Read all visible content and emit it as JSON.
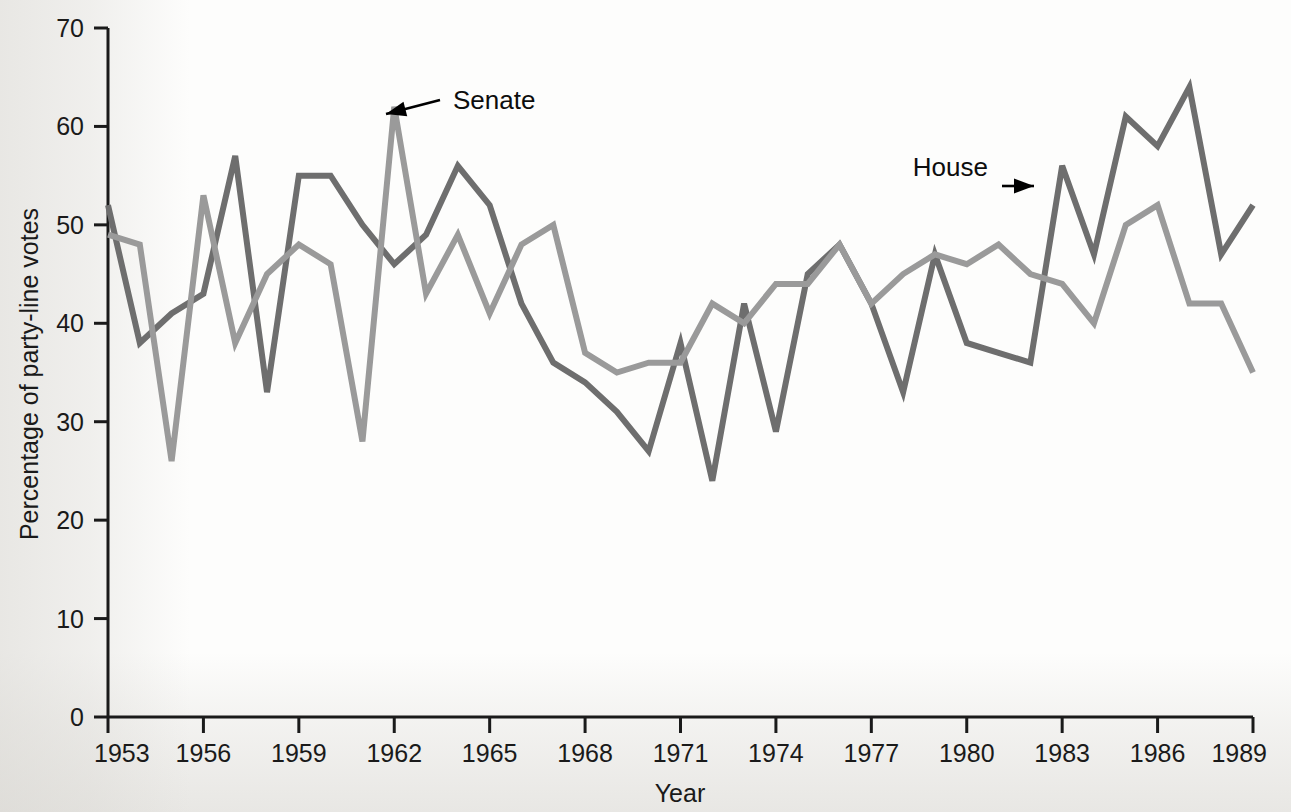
{
  "chart_data": {
    "type": "line",
    "title": "",
    "subtitle": "",
    "xlabel": "Year",
    "ylabel": "Percentage of party-line votes",
    "xlim": [
      1953,
      1989
    ],
    "ylim": [
      0,
      70
    ],
    "grid": false,
    "legend_position": "inline-annotations",
    "x_ticks": [
      1953,
      1956,
      1959,
      1962,
      1965,
      1968,
      1971,
      1974,
      1977,
      1980,
      1983,
      1986,
      1989
    ],
    "x_tick_labels": [
      "1953",
      "1956",
      "1959",
      "1962",
      "1965",
      "1968",
      "1971",
      "1974",
      "1977",
      "1980",
      "1983",
      "1986",
      "1989"
    ],
    "y_ticks": [
      0,
      10,
      20,
      30,
      40,
      50,
      60,
      70
    ],
    "y_tick_labels": [
      "0",
      "10",
      "20",
      "30",
      "40",
      "50",
      "60",
      "70"
    ],
    "x": [
      1953,
      1954,
      1955,
      1956,
      1957,
      1958,
      1959,
      1960,
      1961,
      1962,
      1963,
      1964,
      1965,
      1966,
      1967,
      1968,
      1969,
      1970,
      1971,
      1972,
      1973,
      1974,
      1975,
      1976,
      1977,
      1978,
      1979,
      1980,
      1981,
      1982,
      1983,
      1984,
      1985,
      1986,
      1987,
      1988,
      1989
    ],
    "series": [
      {
        "name": "House",
        "color": "#6e6e6e",
        "values": [
          52,
          38,
          41,
          43,
          57,
          33,
          55,
          55,
          50,
          46,
          49,
          56,
          52,
          42,
          36,
          34,
          31,
          27,
          38,
          24,
          42,
          29,
          45,
          48,
          42,
          33,
          47,
          38,
          37,
          36,
          56,
          47,
          61,
          58,
          64,
          47,
          52
        ]
      },
      {
        "name": "Senate",
        "color": "#9a9a9a",
        "values": [
          49,
          48,
          26,
          53,
          38,
          45,
          48,
          46,
          28,
          62,
          43,
          49,
          41,
          48,
          50,
          37,
          35,
          36,
          36,
          42,
          40,
          44,
          44,
          48,
          42,
          45,
          47,
          46,
          48,
          45,
          44,
          40,
          50,
          52,
          42,
          42,
          35
        ]
      }
    ],
    "annotations": [
      {
        "text": "Senate",
        "target_x": 1961,
        "target_y": 62
      },
      {
        "text": "House",
        "target_x": 1982,
        "target_y": 56
      }
    ]
  },
  "axes": {
    "y_axis_title": "Percentage of party-line votes",
    "x_axis_title": "Year"
  }
}
